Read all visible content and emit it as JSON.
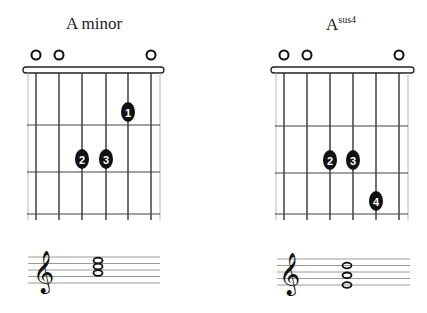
{
  "chords": [
    {
      "name": "A minor",
      "title_main": "A minor",
      "title_sup": "",
      "open_strings_markers": [
        1,
        2,
        6
      ],
      "fingers": [
        {
          "finger": "1",
          "string": 5,
          "fret": 1
        },
        {
          "finger": "2",
          "string": 3,
          "fret": 2
        },
        {
          "finger": "3",
          "string": 4,
          "fret": 2
        }
      ],
      "notation": {
        "clef": "treble",
        "notes": [
          "A4",
          "C5",
          "E5"
        ]
      }
    },
    {
      "name": "Asus4",
      "title_main": "A",
      "title_sup": "sus4",
      "open_strings_markers": [
        1,
        2,
        6
      ],
      "fingers": [
        {
          "finger": "2",
          "string": 3,
          "fret": 2
        },
        {
          "finger": "3",
          "string": 4,
          "fret": 2
        },
        {
          "finger": "4",
          "string": 5,
          "fret": 3
        }
      ],
      "notation": {
        "clef": "treble",
        "notes": [
          "A4",
          "D5",
          "E5"
        ]
      }
    }
  ],
  "colors": {
    "ink": "#111111",
    "string": "#333333",
    "staff": "#9a9a9a",
    "background": "#ffffff"
  }
}
